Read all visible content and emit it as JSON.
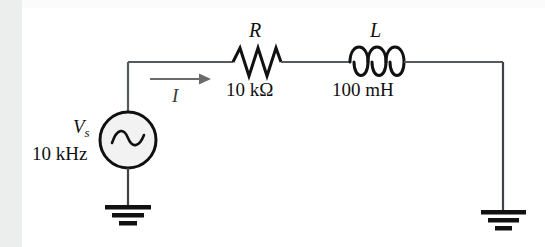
{
  "figure": {
    "type": "circuit-schematic",
    "background_color": "#ffffff",
    "line_color": "#111111",
    "accent_color": "#6b6b6b"
  },
  "source": {
    "symbol": "ac-voltage-source",
    "label": "V",
    "label_subscript": "s",
    "frequency": "10 kHz",
    "waveform_glyph": "sine"
  },
  "components": [
    {
      "name": "resistor",
      "designator": "R",
      "value": "10 kΩ"
    },
    {
      "name": "inductor",
      "designator": "L",
      "value": "100 mH"
    }
  ],
  "current": {
    "label": "I",
    "direction": "right",
    "arrow_glyph": "arrow-right"
  },
  "grounds": [
    {
      "name": "ground-left",
      "symbol": "earth-ground"
    },
    {
      "name": "ground-right",
      "symbol": "earth-ground"
    }
  ]
}
